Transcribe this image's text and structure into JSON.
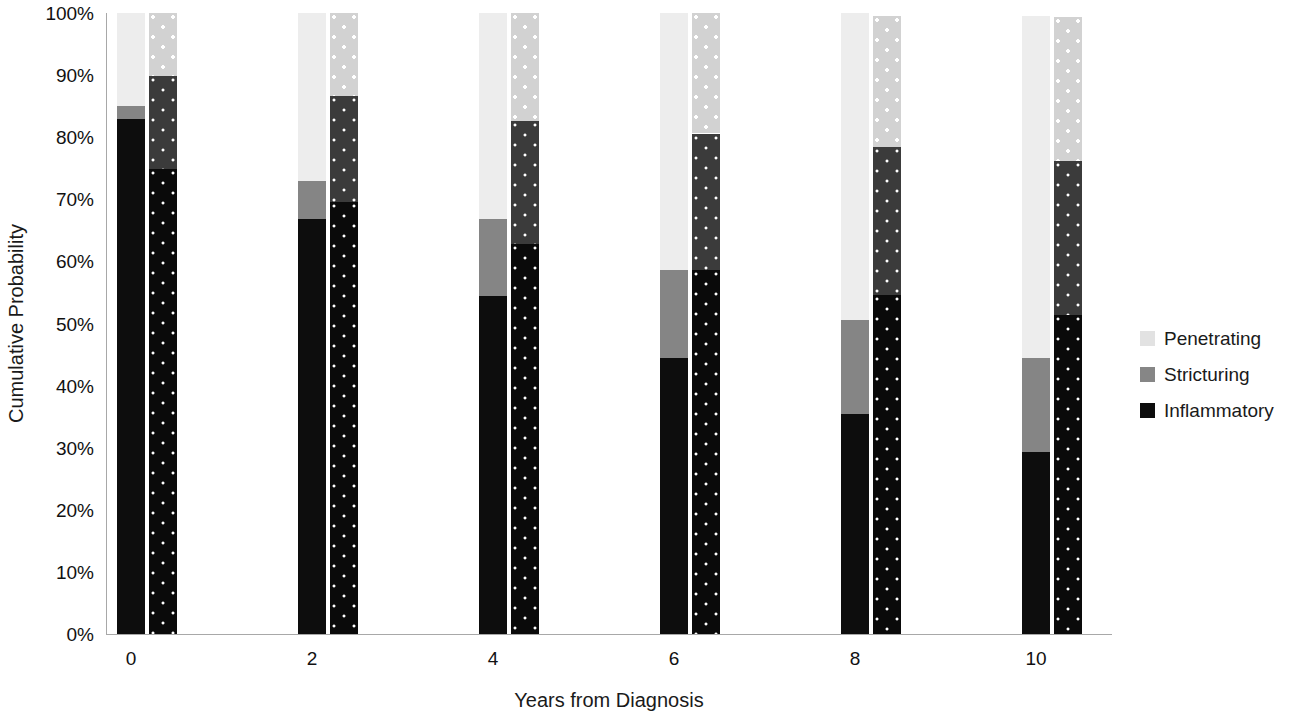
{
  "chart_data": {
    "type": "bar",
    "title": "",
    "subtitle": "",
    "xlabel": "Years from Diagnosis",
    "ylabel": "Cumulative Probability",
    "stacked": true,
    "grid": false,
    "legend_position": "right",
    "ylim": [
      0,
      100
    ],
    "y_ticks": [
      "0%",
      "10%",
      "20%",
      "30%",
      "40%",
      "50%",
      "60%",
      "70%",
      "80%",
      "90%",
      "100%"
    ],
    "y_tick_values": [
      0,
      10,
      20,
      30,
      40,
      50,
      60,
      70,
      80,
      90,
      100
    ],
    "x_ticks": [
      "0",
      "2",
      "4",
      "6",
      "8",
      "10"
    ],
    "categories": [
      "0",
      "2",
      "4",
      "6",
      "8",
      "10"
    ],
    "series": [
      {
        "name": "Inflammatory",
        "color": "#0d0d0d",
        "pattern": "solid"
      },
      {
        "name": "Stricturing",
        "color": "#858585",
        "pattern": "solid"
      },
      {
        "name": "Penetrating",
        "color": "#ededed",
        "pattern": "solid"
      }
    ],
    "groups": [
      {
        "x": "0",
        "bars": [
          {
            "pattern": "solid",
            "inflammatory": 82.9,
            "stricturing": 2.1,
            "penetrating": 15.0,
            "total": 100.0
          },
          {
            "pattern": "dotted",
            "inflammatory": 74.9,
            "stricturing": 14.9,
            "penetrating": 10.2,
            "total": 100.0
          }
        ]
      },
      {
        "x": "2",
        "bars": [
          {
            "pattern": "solid",
            "inflammatory": 66.8,
            "stricturing": 6.1,
            "penetrating": 27.1,
            "total": 100.0
          },
          {
            "pattern": "dotted",
            "inflammatory": 69.6,
            "stricturing": 17.0,
            "penetrating": 13.4,
            "total": 100.0
          }
        ]
      },
      {
        "x": "4",
        "bars": [
          {
            "pattern": "solid",
            "inflammatory": 54.5,
            "stricturing": 12.3,
            "penetrating": 33.2,
            "total": 100.0
          },
          {
            "pattern": "dotted",
            "inflammatory": 62.8,
            "stricturing": 19.8,
            "penetrating": 17.4,
            "total": 100.0
          }
        ]
      },
      {
        "x": "6",
        "bars": [
          {
            "pattern": "solid",
            "inflammatory": 44.5,
            "stricturing": 14.1,
            "penetrating": 41.4,
            "total": 100.0
          },
          {
            "pattern": "dotted",
            "inflammatory": 58.6,
            "stricturing": 22.0,
            "penetrating": 19.4,
            "total": 100.0
          }
        ]
      },
      {
        "x": "8",
        "bars": [
          {
            "pattern": "solid",
            "inflammatory": 35.4,
            "stricturing": 15.1,
            "penetrating": 49.5,
            "total": 100.0
          },
          {
            "pattern": "dotted",
            "inflammatory": 54.6,
            "stricturing": 23.8,
            "penetrating": 21.2,
            "total": 99.6
          }
        ]
      },
      {
        "x": "10",
        "bars": [
          {
            "pattern": "solid",
            "inflammatory": 29.3,
            "stricturing": 15.1,
            "penetrating": 55.2,
            "total": 99.6
          },
          {
            "pattern": "dotted",
            "inflammatory": 51.3,
            "stricturing": 24.9,
            "penetrating": 23.1,
            "total": 99.3
          }
        ]
      }
    ]
  },
  "legend": {
    "items": [
      {
        "label": "Penetrating",
        "swatch": "penetrating"
      },
      {
        "label": "Stricturing",
        "swatch": "stricturing"
      },
      {
        "label": "Inflammatory",
        "swatch": "inflammatory"
      }
    ]
  }
}
